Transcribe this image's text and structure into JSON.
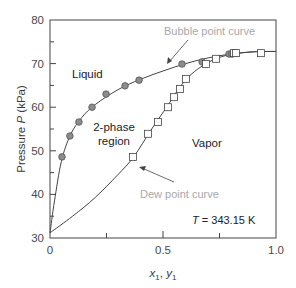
{
  "chart_data": {
    "type": "scatter",
    "title": "",
    "xlabel": "x1, y1",
    "ylabel": "Pressure P (kPa)",
    "xlim": [
      0,
      1.0
    ],
    "ylim": [
      30,
      80
    ],
    "x_ticks": [
      "0",
      "0.5",
      "1.0"
    ],
    "x_minor_ticks": [
      0.25,
      0.75
    ],
    "y_ticks": [
      "30",
      "40",
      "50",
      "60",
      "70",
      "80"
    ],
    "y_minor_ticks": [
      35,
      45,
      55,
      65,
      75
    ],
    "grid": false,
    "series": [
      {
        "name": "Bubble point data (x1)",
        "marker": "circle",
        "fill": "#8c8c8c",
        "points": [
          [
            0.053,
            48.6
          ],
          [
            0.088,
            53.4
          ],
          [
            0.128,
            56.6
          ],
          [
            0.186,
            60.0
          ],
          [
            0.248,
            63.0
          ],
          [
            0.332,
            64.9
          ],
          [
            0.394,
            66.2
          ],
          [
            0.584,
            69.9
          ],
          [
            0.673,
            70.4
          ],
          [
            0.792,
            72.2
          ],
          [
            0.805,
            72.2
          ]
        ]
      },
      {
        "name": "Dew point data (y1)",
        "marker": "square",
        "fill": "#ffffff",
        "points": [
          [
            0.367,
            48.6
          ],
          [
            0.434,
            53.9
          ],
          [
            0.478,
            56.6
          ],
          [
            0.522,
            60.0
          ],
          [
            0.549,
            62.3
          ],
          [
            0.575,
            64.2
          ],
          [
            0.602,
            66.5
          ],
          [
            0.69,
            69.9
          ],
          [
            0.735,
            71.1
          ],
          [
            0.814,
            72.4
          ],
          [
            0.823,
            72.4
          ],
          [
            0.934,
            72.4
          ]
        ]
      },
      {
        "name": "Bubble point curve",
        "type": "line",
        "points": [
          [
            0,
            31.2
          ],
          [
            0.02,
            38.5
          ],
          [
            0.05,
            47.5
          ],
          [
            0.09,
            53.6
          ],
          [
            0.14,
            57.6
          ],
          [
            0.2,
            60.6
          ],
          [
            0.3,
            64.0
          ],
          [
            0.4,
            66.4
          ],
          [
            0.5,
            68.3
          ],
          [
            0.6,
            70.0
          ],
          [
            0.7,
            71.3
          ],
          [
            0.8,
            72.2
          ],
          [
            0.9,
            72.7
          ],
          [
            1.0,
            72.8
          ]
        ]
      },
      {
        "name": "Dew point curve",
        "type": "line",
        "points": [
          [
            0,
            31.2
          ],
          [
            0.1,
            35.0
          ],
          [
            0.2,
            39.3
          ],
          [
            0.3,
            44.5
          ],
          [
            0.37,
            48.6
          ],
          [
            0.45,
            55.0
          ],
          [
            0.52,
            60.3
          ],
          [
            0.58,
            65.0
          ],
          [
            0.64,
            68.2
          ],
          [
            0.72,
            70.8
          ],
          [
            0.8,
            72.1
          ],
          [
            0.9,
            72.7
          ],
          [
            1.0,
            72.8
          ]
        ]
      }
    ],
    "annotations": [
      {
        "text": "Bubble point curve",
        "color": "#a8a8a8"
      },
      {
        "text": "Dew point curve",
        "color": "#a8a8a8"
      },
      {
        "text": "Liquid"
      },
      {
        "text": "2-phase"
      },
      {
        "text": "region"
      },
      {
        "text": "Vapor"
      },
      {
        "text": "T = 343.15 K"
      }
    ]
  },
  "labels": {
    "ylabel_prefix": "Pressure ",
    "ylabel_var": "P",
    "ylabel_unit": " (kPa)",
    "xlabel_x": "x",
    "xlabel_sub1": "1",
    "xlabel_sep": ", ",
    "xlabel_y": "y",
    "xlabel_sub2": "1",
    "bubble": "Bubble point curve",
    "dew": "Dew point curve",
    "liquid": "Liquid",
    "two_phase_1": "2-phase",
    "two_phase_2": "region",
    "vapor": "Vapor",
    "temp_var": "T",
    "temp_value": " = 343.15 K",
    "x0": "0",
    "x05": "0.5",
    "x10": "1.0",
    "y30": "30",
    "y40": "40",
    "y50": "50",
    "y60": "60",
    "y70": "70",
    "y80": "80"
  }
}
